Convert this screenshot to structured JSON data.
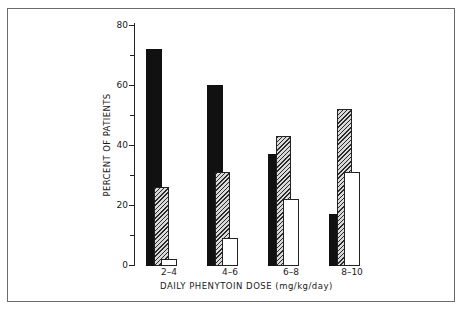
{
  "chart_data": {
    "type": "bar",
    "title": "",
    "xlabel": "DAILY PHENYTOIN DOSE (mg/kg/day)",
    "ylabel": "PERCENT OF PATIENTS",
    "ylim": [
      0,
      80
    ],
    "yticks": [
      0,
      20,
      40,
      60,
      80
    ],
    "yticks_minor": [
      10,
      30,
      50,
      70
    ],
    "grid": false,
    "legend": null,
    "categories": [
      "2-4",
      "4-6",
      "6-8",
      "8-10"
    ],
    "series": [
      {
        "name": "black",
        "style": "solid-black",
        "values": [
          72,
          60,
          37,
          17
        ]
      },
      {
        "name": "hatched",
        "style": "diagonal-hatch",
        "values": [
          26,
          31,
          43,
          52
        ]
      },
      {
        "name": "white",
        "style": "open-white",
        "values": [
          2,
          9,
          22,
          31
        ]
      }
    ]
  },
  "labels": {
    "y_ticks": [
      "0",
      "20",
      "40",
      "60",
      "80"
    ],
    "categories": [
      "2–4",
      "4–6",
      "6–8",
      "8–10"
    ],
    "xlabel": "DAILY PHENYTOIN DOSE (mg/kg/day)",
    "ylabel": "PERCENT OF PATIENTS"
  }
}
